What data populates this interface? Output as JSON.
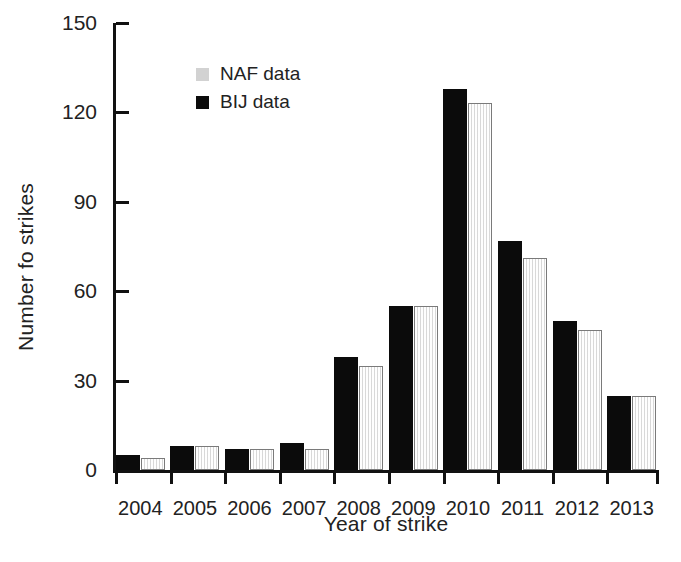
{
  "chart_data": {
    "type": "bar",
    "title": "",
    "xlabel": "Year of strike",
    "ylabel": "Number fo strikes",
    "categories": [
      "2004",
      "2005",
      "2006",
      "2007",
      "2008",
      "2009",
      "2010",
      "2011",
      "2012",
      "2013"
    ],
    "series": [
      {
        "name": "NAF data",
        "color": "#ececec",
        "values": [
          4,
          8,
          7,
          7,
          35,
          55,
          123,
          71,
          47,
          25
        ]
      },
      {
        "name": "BIJ data",
        "color": "#0b0b0b",
        "values": [
          5,
          8,
          7,
          9,
          38,
          55,
          128,
          77,
          50,
          25
        ]
      }
    ],
    "legend": [
      "NAF data",
      "BIJ data"
    ],
    "legend_position": "top-left-inside",
    "ylim": [
      0,
      150
    ],
    "yticks": [
      0,
      30,
      60,
      90,
      120,
      150
    ],
    "ytick_labels": [
      "0",
      "30",
      "60",
      "90",
      "120",
      "150"
    ],
    "grid": false,
    "series_draw_order": [
      "BIJ data",
      "NAF data"
    ]
  },
  "legend": {
    "naf_label": "NAF data",
    "bij_label": "BIJ data",
    "naf_swatch_color": "#d2d2d2",
    "bij_swatch_color": "#0b0b0b"
  },
  "axes": {
    "x_title": "Year of strike",
    "y_title": "Number fo strikes"
  }
}
